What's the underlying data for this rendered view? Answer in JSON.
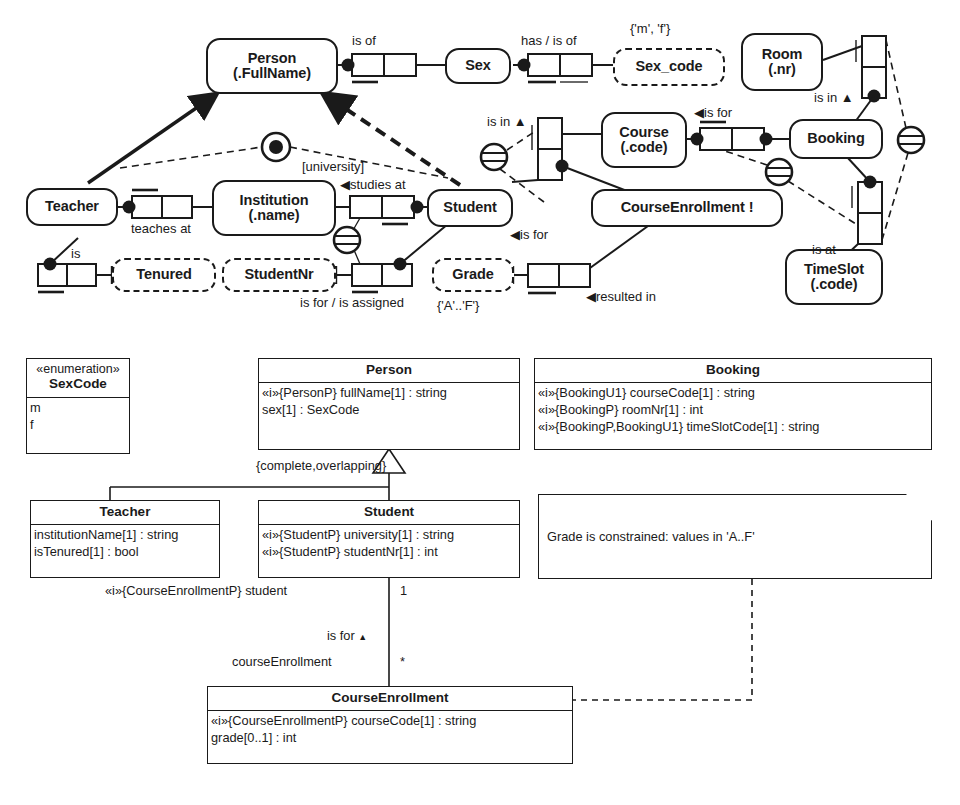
{
  "diagram": {
    "title_orm": "ORM schema",
    "title_uml": "UML class diagram"
  },
  "orm": {
    "entities": [
      {
        "id": "person",
        "name": "Person",
        "ref": "(.FullName)"
      },
      {
        "id": "sex",
        "name": "Sex",
        "ref": ""
      },
      {
        "id": "room",
        "name": "Room",
        "ref": "(.nr)"
      },
      {
        "id": "booking",
        "name": "Booking",
        "ref": ""
      },
      {
        "id": "course",
        "name": "Course",
        "ref": "(.code)"
      },
      {
        "id": "teacher",
        "name": "Teacher",
        "ref": ""
      },
      {
        "id": "institution",
        "name": "Institution",
        "ref": "(.name)"
      },
      {
        "id": "student",
        "name": "Student",
        "ref": ""
      },
      {
        "id": "courseenrollment",
        "name": "CourseEnrollment !",
        "ref": ""
      },
      {
        "id": "timeslot",
        "name": "TimeSlot",
        "ref": "(.code)"
      }
    ],
    "value_types": [
      {
        "id": "sexcode",
        "name": "Sex_code"
      },
      {
        "id": "tenured",
        "name": "Tenured"
      },
      {
        "id": "studentnr",
        "name": "StudentNr"
      },
      {
        "id": "grade",
        "name": "Grade"
      }
    ],
    "labels": [
      {
        "id": "is-of-person-sex",
        "text": "is of"
      },
      {
        "id": "has-is-of-sex-code",
        "text": "has / is of"
      },
      {
        "id": "sex-code-values",
        "text": "{'m', 'f'}"
      },
      {
        "id": "is-in-course",
        "text": "is in"
      },
      {
        "id": "is-for-course-booking",
        "text": "is for"
      },
      {
        "id": "is-in-room-booking",
        "text": "is in"
      },
      {
        "id": "is-at-timeslot",
        "text": "is at"
      },
      {
        "id": "university-subscript",
        "text": "[university]"
      },
      {
        "id": "studies-at",
        "text": "studies at"
      },
      {
        "id": "teaches-at",
        "text": "teaches at"
      },
      {
        "id": "is-tenured",
        "text": "is"
      },
      {
        "id": "is-for-studentnr",
        "text": "is for / is assigned"
      },
      {
        "id": "is-for-student-enrollment",
        "text": "is for"
      },
      {
        "id": "resulted-in",
        "text": "resulted in"
      },
      {
        "id": "grade-values",
        "text": "{'A'..'F'}"
      }
    ]
  },
  "uml": {
    "classes": [
      {
        "id": "sexcode",
        "stereotype": "«enumeration»",
        "name": "SexCode",
        "attributes": [
          "m",
          "f"
        ]
      },
      {
        "id": "person",
        "stereotype": "",
        "name": "Person",
        "attributes": [
          "«i»{PersonP} fullName[1] : string",
          "sex[1] : SexCode"
        ]
      },
      {
        "id": "booking",
        "stereotype": "",
        "name": "Booking",
        "attributes": [
          "«i»{BookingU1} courseCode[1] : string",
          "«i»{BookingP} roomNr[1] : int",
          "«i»{BookingP,BookingU1} timeSlotCode[1] : string"
        ]
      },
      {
        "id": "teacher",
        "stereotype": "",
        "name": "Teacher",
        "attributes": [
          "institutionName[1] : string",
          "isTenured[1] : bool"
        ]
      },
      {
        "id": "student",
        "stereotype": "",
        "name": "Student",
        "attributes": [
          "«i»{StudentP} university[1] : string",
          "«i»{StudentP} studentNr[1] : int"
        ]
      },
      {
        "id": "courseenrollment",
        "stereotype": "",
        "name": "CourseEnrollment",
        "attributes": [
          "«i»{CourseEnrollmentP} courseCode[1] : string",
          "grade[0..1] : int"
        ]
      }
    ],
    "note": {
      "id": "grade-note",
      "text": "Grade is constrained: values in 'A..F'"
    },
    "generalization_constraint": "{complete,overlapping}",
    "association": {
      "role_student": "«i»{CourseEnrollmentP} student",
      "mult_student": "1",
      "name": "is for",
      "role_enrollment": "courseEnrollment",
      "mult_enrollment": "*"
    }
  }
}
